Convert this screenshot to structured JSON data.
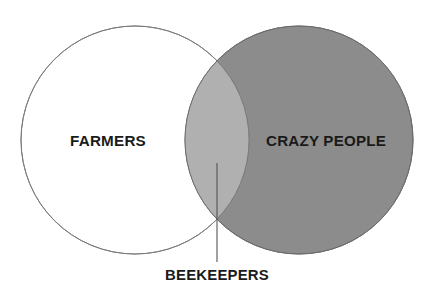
{
  "diagram": {
    "type": "venn",
    "sets": [
      {
        "id": "farmers",
        "label": "FARMERS",
        "fill": "#ffffff",
        "stroke": "#7a7a7a"
      },
      {
        "id": "crazy_people",
        "label": "CRAZY PEOPLE",
        "fill": "#8c8c8c",
        "stroke": "#6a6a6a"
      }
    ],
    "intersection": {
      "label": "BEEKEEPERS",
      "fill": "#b0b0b0"
    },
    "colors": {
      "background": "#ffffff",
      "text": "#1a1a1a",
      "leader_line": "#555555"
    }
  }
}
